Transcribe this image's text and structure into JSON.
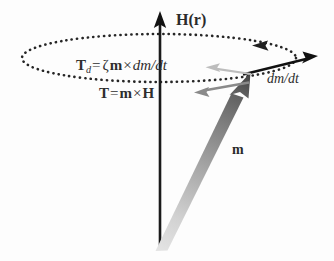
{
  "diagram": {
    "background_color": "#fdfdfd",
    "labels": {
      "field": "H(r)",
      "moment": "m",
      "rate": "dm/dt",
      "damping_torque": {
        "symbol": "T",
        "subscript": "d",
        "equals": "=",
        "coefficient": "ζ",
        "vector_a": "m",
        "cross": "×",
        "vector_b": "dm/dt",
        "full": "T_d = ζm × dm/dt"
      },
      "torque": {
        "symbol": "T",
        "equals": "=",
        "vector_a": "m",
        "cross": "×",
        "vector_b": "H",
        "full": "T = m × H"
      }
    },
    "colors": {
      "field_axis": "#1a1a1a",
      "orbit_dotted": "#262626",
      "rate_arrow": "#111111",
      "torque_arrow": "#8a8a8a",
      "damping_arrow": "#b9b9b9",
      "moment_tip": "#4f4f4f",
      "moment_base": "#dcdcdc",
      "text": "#2b2b2b"
    },
    "geometry": {
      "origin": [
        160,
        250
      ],
      "field_tip": [
        160,
        14
      ],
      "moment_tip": [
        250,
        74
      ],
      "orbit_center": [
        159,
        58
      ],
      "orbit_rx": 137,
      "orbit_ry": 24,
      "rate_arrow_from": [
        246,
        73
      ],
      "rate_arrow_to": [
        316,
        57
      ],
      "torque_arrow_from": [
        249,
        83
      ],
      "torque_arrow_to": [
        196,
        92
      ],
      "damping_arrow_from": [
        250,
        74
      ],
      "damping_arrow_to": [
        207,
        68
      ]
    }
  }
}
